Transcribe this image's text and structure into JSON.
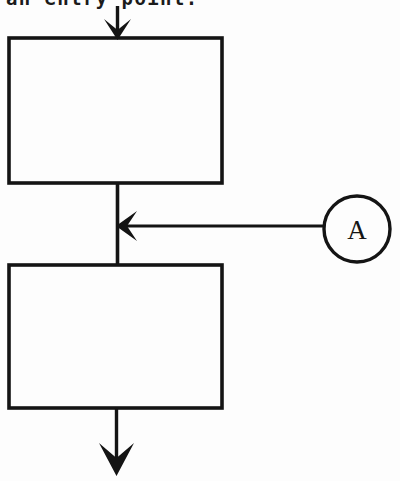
{
  "page": {
    "width": 400,
    "height": 481,
    "background_color": "#fdfdfd",
    "ink_color": "#141414"
  },
  "caption": {
    "text": "an entry point.",
    "note": "clipped at top edge of image"
  },
  "diagram": {
    "type": "flowchart-fragment",
    "process_box_1": {
      "label": "",
      "x": 9,
      "y": 38,
      "width": 213,
      "height": 145
    },
    "process_box_2": {
      "label": "",
      "x": 9,
      "y": 265,
      "width": 213,
      "height": 143
    },
    "entry_arrow": {
      "label": "",
      "direction": "down",
      "from_y": 5,
      "to_y": 38,
      "x": 117
    },
    "link_segment_top": {
      "label": "",
      "x": 117,
      "from_y": 183,
      "to_y": 265
    },
    "exit_arrow": {
      "label": "",
      "direction": "down",
      "from_y": 408,
      "to_y": 474,
      "x": 116
    },
    "connector_circle": {
      "label": "A",
      "cx": 357,
      "cy": 229,
      "r": 33
    },
    "connector_arrow": {
      "label": "",
      "direction": "left",
      "from_x": 324,
      "to_x": 117,
      "y": 226
    }
  }
}
